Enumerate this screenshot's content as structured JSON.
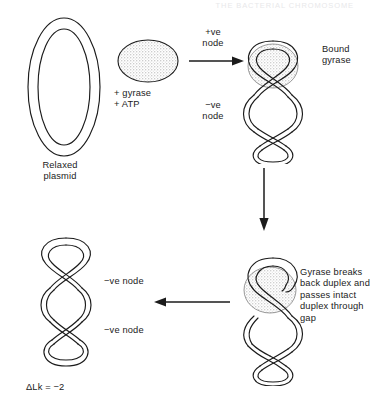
{
  "figure": {
    "header_running_title": "THE BACTERIAL CHROMOSOME",
    "background_color": "#ffffff",
    "ink_color": "#1b1b1b",
    "stipple_color": "#9a9a9a"
  },
  "panels": {
    "relaxed_plasmid": {
      "label": "Relaxed\nplasmid",
      "shape": "double-line-ellipse"
    },
    "enzyme": {
      "label": "+ gyrase\n+ ATP",
      "shape": "stippled-oval"
    },
    "bound_gyrase": {
      "label": "Bound\ngyrase",
      "node_positive": "+ve\nnode",
      "node_negative": "−ve\nnode"
    },
    "strand_passage": {
      "caption": "Gyrase breaks\nback duplex and\npasses intact\nduplex through\ngap"
    },
    "supercoiled_product": {
      "node_label_upper": "−ve node",
      "node_label_lower": "−ve node",
      "linking_number_change": "ΔLk = −2"
    }
  },
  "arrows": {
    "step1": "arrow-right",
    "step2": "arrow-down",
    "step3": "arrow-left"
  }
}
